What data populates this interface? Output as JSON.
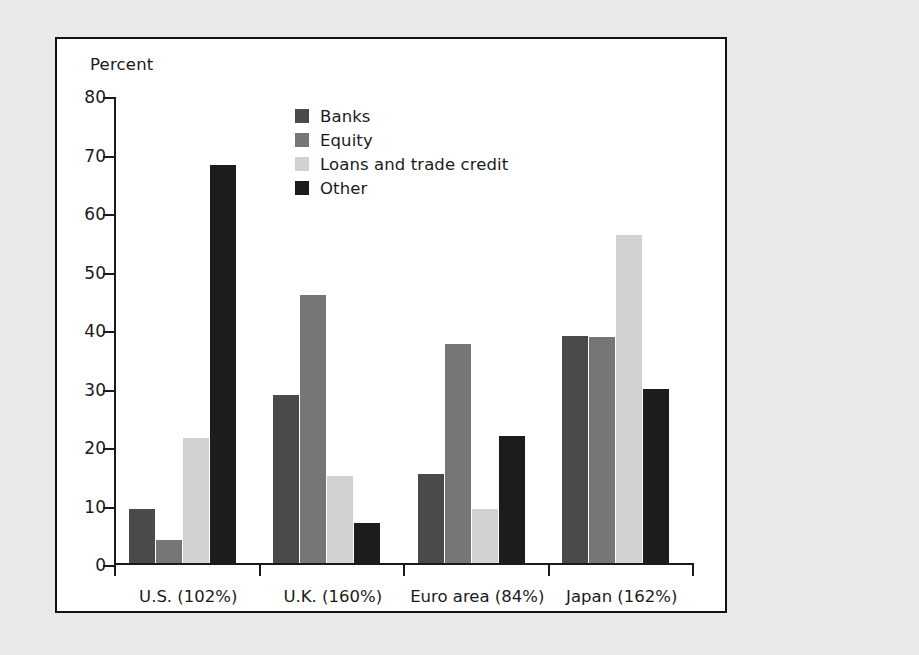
{
  "chart_data": {
    "type": "bar",
    "title": "",
    "xlabel": "",
    "ylabel": "Percent",
    "ylim": [
      0,
      80
    ],
    "ytick_step": 10,
    "yticks": [
      80,
      70,
      60,
      50,
      40,
      30,
      20,
      10,
      0
    ],
    "grid": false,
    "legend_position": "inside-upper-center-left",
    "categories": [
      "U.S. (102%)",
      "U.K. (160%)",
      "Euro area (84%)",
      "Japan (162%)"
    ],
    "series": [
      {
        "name": "Banks",
        "color": "#4a4a4a",
        "values": [
          9.3,
          28.8,
          15.3,
          38.8
        ]
      },
      {
        "name": "Equity",
        "color": "#767676",
        "values": [
          4.0,
          45.9,
          37.5,
          38.6
        ]
      },
      {
        "name": "Loans and trade credit",
        "color": "#d2d2d2",
        "values": [
          21.3,
          14.9,
          9.2,
          56.0
        ]
      },
      {
        "name": "Other",
        "color": "#1c1c1c",
        "values": [
          68.0,
          6.8,
          21.7,
          29.7
        ]
      }
    ]
  },
  "colors": {
    "page_background": "#e9e9e7",
    "panel_background": "#ffffff",
    "frame_border": "#121212",
    "axis": "#1a1a1a",
    "text": "#1a1a1a"
  }
}
